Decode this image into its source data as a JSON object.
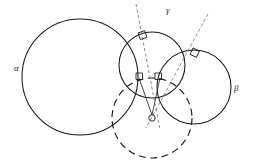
{
  "figure": {
    "background_color": "#ffffff",
    "stroke_color": "#1a1a1a",
    "dashed_stroke_color": "#6f6f6f",
    "width": 256,
    "height": 166,
    "labels": {
      "alpha": "α",
      "gamma": "γ",
      "beta": "β",
      "center_point": "O"
    },
    "circles": [
      {
        "name": "alpha",
        "label": "α",
        "style": "solid",
        "cx": 80,
        "cy": 77,
        "r": 58
      },
      {
        "name": "gamma",
        "label": "γ",
        "style": "solid",
        "cx": 152,
        "cy": 65,
        "r": 33
      },
      {
        "name": "beta",
        "label": "β",
        "style": "solid",
        "cx": 194,
        "cy": 87,
        "r": 37
      },
      {
        "name": "radical-circle",
        "label": "",
        "style": "dashed",
        "cx": 152,
        "cy": 118,
        "r": 40
      }
    ],
    "point_o": {
      "name": "O",
      "cx": 152,
      "cy": 118,
      "marker_radius": 3.2
    },
    "dashed_lines": [
      {
        "name": "radical-axis-alpha-gamma",
        "x1": 136,
        "y1": 4,
        "x2": 160,
        "y2": 130
      },
      {
        "name": "radical-axis-gamma-beta",
        "x1": 208,
        "y1": 14,
        "x2": 146,
        "y2": 128
      }
    ],
    "solid_lines": [
      {
        "name": "radius-o-to-left-tangency",
        "x1": 152,
        "y1": 115,
        "x2": 139,
        "y2": 78
      },
      {
        "name": "radius-o-to-right-tangency",
        "x1": 152,
        "y1": 115,
        "x2": 160,
        "y2": 78
      }
    ],
    "right_angle_marks": [
      {
        "name": "right-angle-alpha-gamma-upper",
        "x": 138,
        "y": 33,
        "rotation": -20
      },
      {
        "name": "right-angle-gamma-beta-upper",
        "x": 193,
        "y": 48,
        "rotation": 25
      },
      {
        "name": "right-angle-left-inner",
        "x": 138,
        "y": 76,
        "rotation": 0
      },
      {
        "name": "right-angle-right-inner",
        "x": 157,
        "y": 76,
        "rotation": 0
      }
    ]
  }
}
